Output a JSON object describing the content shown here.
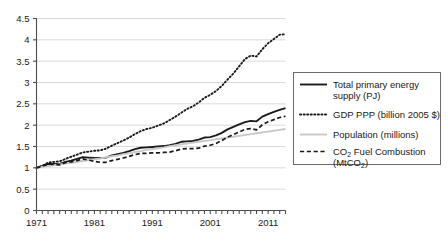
{
  "chart_data": {
    "type": "line",
    "title": "",
    "subtitle": "",
    "xlabel": "",
    "ylabel": "",
    "xlim": [
      1971,
      2014
    ],
    "ylim": [
      0,
      4.5
    ],
    "grid": true,
    "grid_axis": "y",
    "legend_position": "right",
    "y_ticks": [
      "0",
      "0.5",
      "1",
      "1.5",
      "2",
      "2.5",
      "3",
      "3.5",
      "4",
      "4.5"
    ],
    "y_tick_values": [
      0,
      0.5,
      1,
      1.5,
      2,
      2.5,
      3,
      3.5,
      4,
      4.5
    ],
    "x_ticks": [
      "1971",
      "1981",
      "1991",
      "2001",
      "2011"
    ],
    "x_tick_values": [
      1971,
      1981,
      1991,
      2001,
      2011
    ],
    "x_minor_tick_interval": 1,
    "x": [
      1971,
      1972,
      1973,
      1974,
      1975,
      1976,
      1977,
      1978,
      1979,
      1980,
      1981,
      1982,
      1983,
      1984,
      1985,
      1986,
      1987,
      1988,
      1989,
      1990,
      1991,
      1992,
      1993,
      1994,
      1995,
      1996,
      1997,
      1998,
      1999,
      2000,
      2001,
      2002,
      2003,
      2004,
      2005,
      2006,
      2007,
      2008,
      2009,
      2010,
      2011,
      2012,
      2013,
      2014
    ],
    "series": [
      {
        "name": "Total primary energy supply (PJ)",
        "style": "solid",
        "color": "#1a1a1a",
        "width": 1.9,
        "values": [
          1.0,
          1.04,
          1.09,
          1.09,
          1.09,
          1.14,
          1.17,
          1.21,
          1.25,
          1.24,
          1.23,
          1.23,
          1.24,
          1.29,
          1.32,
          1.35,
          1.39,
          1.44,
          1.47,
          1.48,
          1.49,
          1.5,
          1.51,
          1.53,
          1.56,
          1.61,
          1.62,
          1.63,
          1.66,
          1.71,
          1.72,
          1.76,
          1.82,
          1.9,
          1.96,
          2.02,
          2.07,
          2.1,
          2.09,
          2.2,
          2.26,
          2.31,
          2.36,
          2.4
        ]
      },
      {
        "name": "GDP PPP (billion 2005 $)",
        "style": "dotted",
        "color": "#1a1a1a",
        "width": 1.9,
        "values": [
          1.0,
          1.05,
          1.12,
          1.14,
          1.15,
          1.21,
          1.26,
          1.31,
          1.36,
          1.38,
          1.4,
          1.41,
          1.45,
          1.52,
          1.58,
          1.64,
          1.71,
          1.79,
          1.86,
          1.91,
          1.94,
          1.99,
          2.04,
          2.12,
          2.2,
          2.29,
          2.38,
          2.44,
          2.53,
          2.64,
          2.71,
          2.8,
          2.92,
          3.07,
          3.21,
          3.38,
          3.55,
          3.63,
          3.61,
          3.78,
          3.92,
          4.02,
          4.12,
          4.13
        ]
      },
      {
        "name": "Population (millions)",
        "style": "solid",
        "color": "#c8c8c8",
        "width": 1.9,
        "values": [
          1.0,
          1.02,
          1.04,
          1.06,
          1.08,
          1.1,
          1.12,
          1.14,
          1.16,
          1.18,
          1.2,
          1.22,
          1.25,
          1.27,
          1.29,
          1.32,
          1.34,
          1.37,
          1.39,
          1.42,
          1.44,
          1.46,
          1.48,
          1.51,
          1.53,
          1.55,
          1.57,
          1.59,
          1.61,
          1.63,
          1.65,
          1.67,
          1.69,
          1.71,
          1.73,
          1.75,
          1.77,
          1.79,
          1.81,
          1.83,
          1.85,
          1.87,
          1.89,
          1.91
        ]
      },
      {
        "name": "CO2 Fuel Combustion (MtCO2)",
        "style": "dashed",
        "color": "#1a1a1a",
        "width": 1.7,
        "values": [
          1.0,
          1.04,
          1.09,
          1.08,
          1.07,
          1.12,
          1.14,
          1.17,
          1.21,
          1.18,
          1.15,
          1.13,
          1.13,
          1.17,
          1.2,
          1.23,
          1.27,
          1.31,
          1.34,
          1.34,
          1.35,
          1.35,
          1.36,
          1.37,
          1.4,
          1.44,
          1.45,
          1.45,
          1.46,
          1.51,
          1.53,
          1.57,
          1.64,
          1.72,
          1.78,
          1.84,
          1.9,
          1.92,
          1.89,
          2.01,
          2.08,
          2.13,
          2.18,
          2.21
        ]
      }
    ],
    "legend": [
      {
        "key": "tpes",
        "style": "solid",
        "color": "#1a1a1a",
        "line1": "Total primary energy",
        "line2": "supply (PJ)",
        "line1_sub": "",
        "line2_sub": ""
      },
      {
        "key": "gdp",
        "style": "dotted",
        "color": "#1a1a1a",
        "line1": "GDP PPP (billion 2005 $)",
        "line2": "",
        "line1_sub": "",
        "line2_sub": ""
      },
      {
        "key": "population",
        "style": "solid",
        "color": "#c8c8c8",
        "line1": "Population (millions)",
        "line2": "",
        "line1_sub": "",
        "line2_sub": ""
      },
      {
        "key": "co2",
        "style": "dashed",
        "color": "#1a1a1a",
        "line1_pre": "CO",
        "line1_sub": "2",
        "line1_post": " Fuel Combustion",
        "line2_pre": "(MtCO",
        "line2_sub": "2",
        "line2_post": ")"
      }
    ]
  },
  "colors": {
    "axis": "#4d4d4d",
    "grid": "#d9d9d9",
    "text": "#1a1a1a",
    "legend_border": "#6b6b6b",
    "background": "#ffffff",
    "population_line": "#c8c8c8"
  }
}
